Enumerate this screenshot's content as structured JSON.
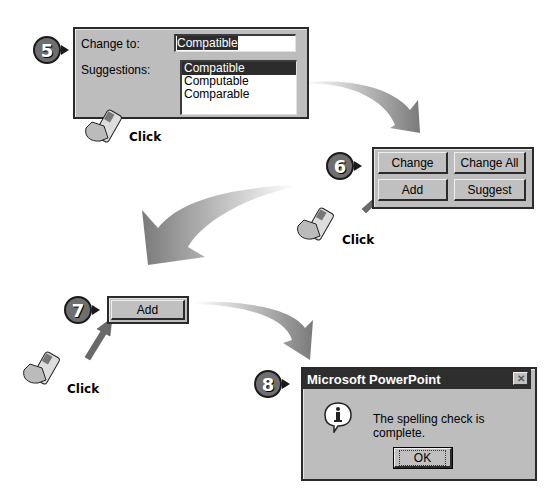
{
  "steps": [
    {
      "number": "5",
      "dialog": {
        "change_to_label": "Change to:",
        "change_to_value": "Compatible",
        "suggestions_label": "Suggestions:",
        "suggestions": [
          "Compatible",
          "Computable",
          "Comparable"
        ],
        "selected_index": 0
      },
      "action": "Click"
    },
    {
      "number": "6",
      "buttons": [
        "Change",
        "Change All",
        "Add",
        "Suggest"
      ],
      "action": "Click"
    },
    {
      "number": "7",
      "button": "Add",
      "action": "Click"
    },
    {
      "number": "8",
      "message_box": {
        "title": "Microsoft PowerPoint",
        "close_glyph": "✕",
        "icon": "info-icon",
        "message": "The spelling check is complete.",
        "ok_label": "OK"
      }
    }
  ],
  "colors": {
    "panel_bg": "#bdbdbd",
    "highlight": "#2c2c2c",
    "title_bar": "#2e2e2e",
    "badge": "#6e6e6e"
  }
}
